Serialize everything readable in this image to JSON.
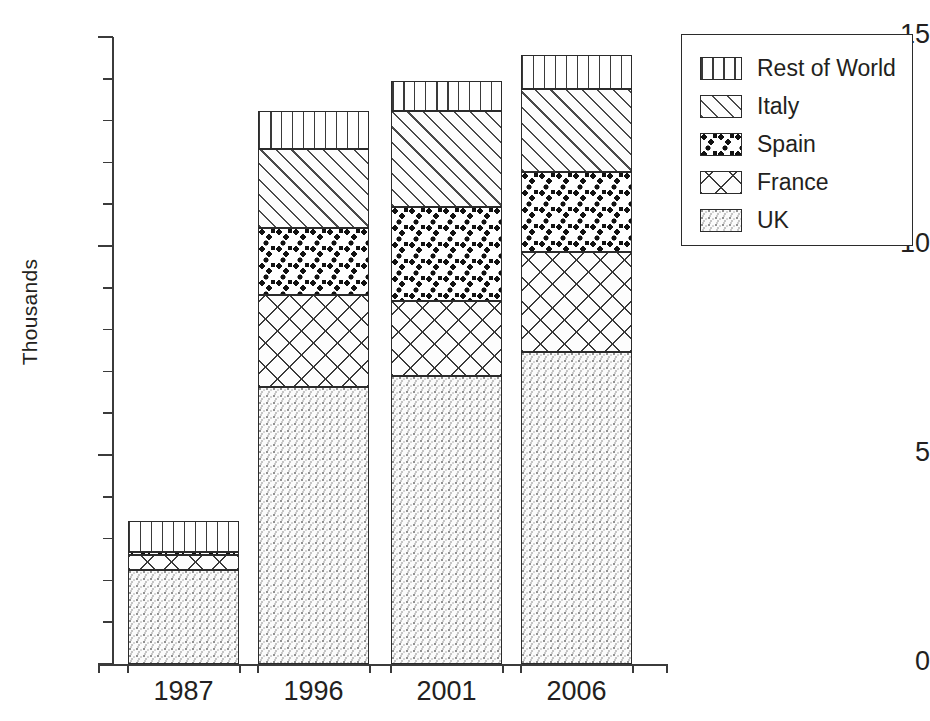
{
  "chart_data": {
    "type": "bar",
    "subtype": "stacked-bar",
    "title": "",
    "xlabel": "",
    "ylabel": "Thousands",
    "categories": [
      "1987",
      "1996",
      "2001",
      "2006"
    ],
    "ylim": [
      0,
      15
    ],
    "y_tick_labels": [
      "0",
      "5",
      "10",
      "15"
    ],
    "y_major_ticks": [
      0,
      5,
      10,
      15
    ],
    "y_minor_tick_interval": 1,
    "grid": false,
    "legend_position": "right-outside",
    "stack_order_bottom_to_top": [
      "UK",
      "France",
      "Spain",
      "Italy",
      "Rest of World"
    ],
    "series": [
      {
        "name": "UK",
        "pattern": "fine-stipple",
        "values": [
          2.25,
          6.63,
          6.89,
          7.46
        ]
      },
      {
        "name": "France",
        "pattern": "crosshatch",
        "values": [
          0.35,
          2.2,
          1.8,
          2.4
        ]
      },
      {
        "name": "Spain",
        "pattern": "heavy-dots",
        "values": [
          0.08,
          1.6,
          2.25,
          1.9
        ]
      },
      {
        "name": "Italy",
        "pattern": "diagonal-hatch",
        "values": [
          0.0,
          1.9,
          2.3,
          2.0
        ]
      },
      {
        "name": "Rest of World",
        "pattern": "vertical-lines",
        "values": [
          0.75,
          0.9,
          0.7,
          0.8
        ]
      }
    ],
    "totals": [
      3.43,
      13.23,
      13.94,
      14.56
    ],
    "colors": {
      "ink": "#231f20",
      "axis": "#3b3b3b",
      "background": "#ffffff"
    }
  },
  "legend": {
    "items": [
      {
        "label": "Rest of World"
      },
      {
        "label": "Italy"
      },
      {
        "label": "Spain"
      },
      {
        "label": "France"
      },
      {
        "label": "UK"
      }
    ]
  },
  "axes": {
    "y_title": "Thousands",
    "y_labels": [
      {
        "text": "15",
        "value": 15
      },
      {
        "text": "10",
        "value": 10
      },
      {
        "text": "5",
        "value": 5
      },
      {
        "text": "0",
        "value": 0
      }
    ],
    "x_labels": [
      "1987",
      "1996",
      "2001",
      "2006"
    ]
  }
}
